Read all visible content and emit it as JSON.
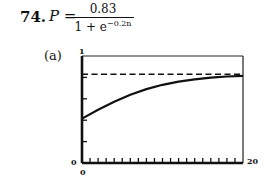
{
  "problem": {
    "number": "74.",
    "lhs": "P =",
    "numerator": "0.83",
    "denominator_base": "1 + e",
    "denominator_exponent": "−0.2n",
    "part_label": "(a)"
  },
  "chart_data": {
    "type": "line",
    "xlabel": "",
    "ylabel": "",
    "xlim": [
      0,
      20
    ],
    "ylim": [
      0,
      1
    ],
    "x_tick_labels": {
      "min": "0",
      "max": "20"
    },
    "y_tick_labels": {
      "min": "0",
      "max": "1"
    },
    "x_minor_ticks": 20,
    "y_minor_ticks": 5,
    "grid": false,
    "series": [
      {
        "name": "P(n)",
        "style": "solid",
        "x": [
          0,
          2,
          4,
          6,
          8,
          10,
          12,
          14,
          16,
          18,
          20
        ],
        "values": [
          0.415,
          0.497,
          0.573,
          0.638,
          0.691,
          0.731,
          0.761,
          0.782,
          0.797,
          0.808,
          0.815
        ]
      },
      {
        "name": "asymptote",
        "style": "dashed",
        "x": [
          0,
          20
        ],
        "values": [
          0.83,
          0.83
        ]
      }
    ]
  }
}
